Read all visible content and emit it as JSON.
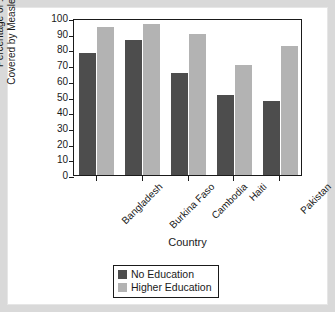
{
  "chart_data": {
    "type": "bar",
    "title": "",
    "xlabel": "Country",
    "ylabel_line1": "Percentage of 1-Year-Olds",
    "ylabel_line2": "Covered by Measles Immunization",
    "categories": [
      "Bangladesh",
      "Burkina Faso",
      "Cambodia",
      "Haiti",
      "Pakistan"
    ],
    "series": [
      {
        "name": "No Education",
        "color": "#4d4d4d",
        "values": [
          78,
          86,
          65,
          51,
          47
        ]
      },
      {
        "name": "Higher Education",
        "color": "#b3b3b3",
        "values": [
          94,
          96,
          90,
          70,
          82
        ]
      }
    ],
    "ylim": [
      0,
      100
    ],
    "yticks": [
      0,
      10,
      20,
      30,
      40,
      50,
      60,
      70,
      80,
      90,
      100
    ],
    "ytick_labels": [
      "0",
      "10",
      "20",
      "30",
      "40",
      "50",
      "60",
      "70",
      "80",
      "90",
      "100"
    ],
    "grid": false,
    "legend_position": "bottom-center"
  },
  "legend": {
    "entries": [
      {
        "label": "No Education",
        "swatch": "dark"
      },
      {
        "label": "Higher Education",
        "swatch": "light"
      }
    ]
  },
  "colors": {
    "no_education": "#4d4d4d",
    "higher_education": "#b3b3b3",
    "axis": "#1a1a1a",
    "frame": "#d9d9d9",
    "background": "#ffffff"
  }
}
